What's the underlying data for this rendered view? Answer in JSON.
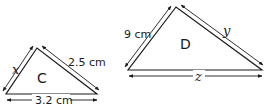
{
  "triangles": [
    {
      "name": "C",
      "sides": {
        "left": "x",
        "right": "2.5 cm",
        "base": "3.2 cm"
      }
    },
    {
      "name": "D",
      "sides": {
        "left": "9 cm",
        "right": "y",
        "base": "z"
      }
    }
  ],
  "colors": {
    "stroke": "#1a1a1a",
    "background": "#ffffff"
  }
}
